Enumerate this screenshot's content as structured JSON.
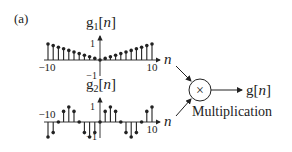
{
  "panel_label": "(a)",
  "colors": {
    "ink": "#222222",
    "background": "#ffffff"
  },
  "signals": [
    {
      "id": "g1",
      "label_base": "g",
      "label_sub": "1",
      "label_arg": "n",
      "axis_label": "n",
      "tick_pos": "1",
      "tick_neg": "−1",
      "x_min_label": "−10",
      "x_max_label": "10",
      "n": [
        -10,
        -9,
        -8,
        -7,
        -6,
        -5,
        -4,
        -3,
        -2,
        -1,
        0,
        1,
        2,
        3,
        4,
        5,
        6,
        7,
        8,
        9,
        10
      ],
      "values": [
        1.0,
        0.9,
        0.8,
        0.7,
        0.6,
        0.5,
        0.4,
        0.3,
        0.2,
        0.1,
        0.0,
        0.1,
        0.2,
        0.3,
        0.4,
        0.5,
        0.6,
        0.7,
        0.8,
        0.9,
        1.0
      ]
    },
    {
      "id": "g2",
      "label_base": "g",
      "label_sub": "2",
      "label_arg": "n",
      "axis_label": "n",
      "tick_pos": "1",
      "tick_neg": "−1",
      "x_min_label": "−10",
      "x_max_label": "10",
      "n": [
        -10,
        -9,
        -8,
        -7,
        -6,
        -5,
        -4,
        -3,
        -2,
        -1,
        0,
        1,
        2,
        3,
        4,
        5,
        6,
        7,
        8,
        9,
        10
      ],
      "values": [
        -1.0,
        -0.707,
        0.0,
        0.707,
        1.0,
        0.707,
        0.0,
        -0.707,
        -1.0,
        -0.707,
        0.0,
        0.707,
        1.0,
        0.707,
        0.0,
        -0.707,
        -1.0,
        -0.707,
        0.0,
        0.707,
        1.0
      ]
    }
  ],
  "multiplier": {
    "symbol": "×",
    "caption": "Multiplication",
    "output_label_base": "g",
    "output_label_arg": "n"
  }
}
